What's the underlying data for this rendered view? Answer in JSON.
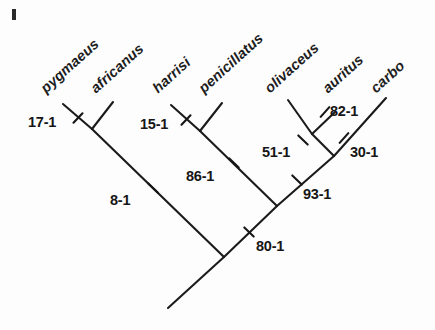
{
  "figure": {
    "type": "cladogram",
    "corner_mark": "I",
    "line_color": "#1b1b1b",
    "background": "#fdfdfd"
  },
  "taxa": [
    {
      "name": "pygmaeus",
      "label": "pygmaeus",
      "x": 48,
      "y": 80,
      "rotation": -42
    },
    {
      "name": "africanus",
      "label": "africanus",
      "x": 98,
      "y": 80,
      "rotation": -42
    },
    {
      "name": "harrisi",
      "label": "harrisi",
      "x": 160,
      "y": 80,
      "rotation": -42
    },
    {
      "name": "penicillatus",
      "label": "penicillatus",
      "x": 206,
      "y": 80,
      "rotation": -42
    },
    {
      "name": "olivaceus",
      "label": "olivaceus",
      "x": 272,
      "y": 80,
      "rotation": -42
    },
    {
      "name": "auritus",
      "label": "auritus",
      "x": 330,
      "y": 80,
      "rotation": -42
    },
    {
      "name": "carbo",
      "label": "carbo",
      "x": 378,
      "y": 80,
      "rotation": -42
    }
  ],
  "characters": [
    {
      "id": "17-1",
      "label": "17-1",
      "label_x": 28,
      "label_y": 114,
      "tick_x": 78,
      "tick_y": 118,
      "tick_angle": -46
    },
    {
      "id": "15-1",
      "label": "15-1",
      "label_x": 140,
      "label_y": 116,
      "tick_x": 186,
      "tick_y": 120,
      "tick_angle": -46
    },
    {
      "id": "82-1",
      "label": "82-1",
      "label_x": 330,
      "label_y": 103,
      "tick_x": 325,
      "tick_y": 112,
      "tick_angle": -48
    },
    {
      "id": "51-1",
      "label": "51-1",
      "label_x": 262,
      "label_y": 144,
      "tick_x": 303,
      "tick_y": 140,
      "tick_angle": 44
    },
    {
      "id": "30-1",
      "label": "30-1",
      "label_x": 350,
      "label_y": 144,
      "tick_x": 344,
      "tick_y": 138,
      "tick_angle": -48
    },
    {
      "id": "86-1",
      "label": "86-1",
      "label_x": 186,
      "label_y": 168,
      "tick_x": 234,
      "tick_y": 163,
      "tick_angle": 44
    },
    {
      "id": "93-1",
      "label": "93-1",
      "label_x": 303,
      "label_y": 186,
      "tick_x": 297,
      "tick_y": 180,
      "tick_angle": 44
    },
    {
      "id": "8-1",
      "label": "8-1",
      "label_x": 110,
      "label_y": 192,
      "tick_x": 153,
      "tick_y": 188,
      "tick_angle": 44
    },
    {
      "id": "80-1",
      "label": "80-1",
      "label_x": 256,
      "label_y": 238,
      "tick_x": 249,
      "tick_y": 232,
      "tick_angle": 44
    }
  ],
  "branches": [
    {
      "name": "branch-pygmaeus",
      "x1": 63,
      "y1": 104,
      "x2": 92,
      "y2": 129
    },
    {
      "name": "branch-africanus",
      "x1": 113,
      "y1": 102,
      "x2": 92,
      "y2": 129
    },
    {
      "name": "branch-clade-pyg-afr",
      "x1": 92,
      "y1": 129,
      "x2": 224,
      "y2": 257
    },
    {
      "name": "branch-harrisi",
      "x1": 171,
      "y1": 105,
      "x2": 200,
      "y2": 131
    },
    {
      "name": "branch-penicillatus",
      "x1": 222,
      "y1": 103,
      "x2": 200,
      "y2": 131
    },
    {
      "name": "branch-clade-har-pen",
      "x1": 200,
      "y1": 131,
      "x2": 277,
      "y2": 206
    },
    {
      "name": "branch-olivaceus",
      "x1": 288,
      "y1": 100,
      "x2": 312,
      "y2": 134
    },
    {
      "name": "branch-auritus",
      "x1": 335,
      "y1": 112,
      "x2": 312,
      "y2": 134
    },
    {
      "name": "branch-clade-oli-aur",
      "x1": 312,
      "y1": 134,
      "x2": 334,
      "y2": 156
    },
    {
      "name": "branch-carbo",
      "x1": 386,
      "y1": 98,
      "x2": 334,
      "y2": 156
    },
    {
      "name": "branch-clade-right",
      "x1": 334,
      "y1": 156,
      "x2": 277,
      "y2": 206
    },
    {
      "name": "branch-clade-upper",
      "x1": 277,
      "y1": 206,
      "x2": 224,
      "y2": 257
    },
    {
      "name": "branch-root",
      "x1": 224,
      "y1": 257,
      "x2": 168,
      "y2": 308
    }
  ]
}
